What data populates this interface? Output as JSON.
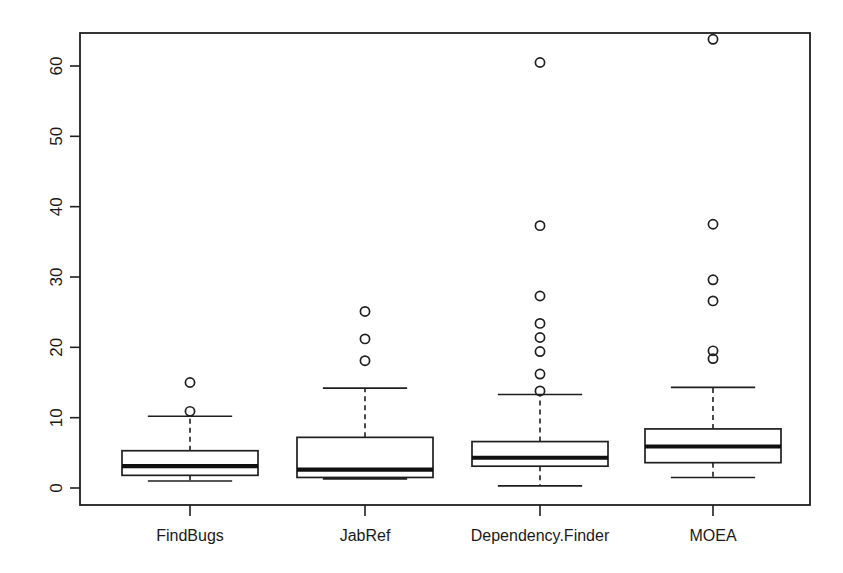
{
  "chart_data": {
    "type": "box",
    "title": "",
    "xlabel": "",
    "ylabel": "",
    "categories": [
      "FindBugs",
      "JabRef",
      "Dependency.Finder",
      "MOEA"
    ],
    "ylim": [
      -2.3,
      66.0
    ],
    "yticks": [
      0,
      10,
      20,
      30,
      40,
      50,
      60
    ],
    "ytick_labels": [
      "0",
      "10",
      "20",
      "30",
      "40",
      "50",
      "60"
    ],
    "ytick_labels_rotated": true,
    "grid": false,
    "legend": "none",
    "frame": "box",
    "series": [
      {
        "name": "FindBugs",
        "min_whisker": 1.0,
        "q1": 1.8,
        "median": 3.1,
        "q3": 5.3,
        "max_whisker": 10.2,
        "outliers": [
          15.0,
          10.9
        ]
      },
      {
        "name": "JabRef",
        "min_whisker": 1.3,
        "q1": 1.5,
        "median": 2.6,
        "q3": 7.2,
        "max_whisker": 14.2,
        "outliers": [
          25.1,
          21.2,
          18.1
        ]
      },
      {
        "name": "Dependency.Finder",
        "min_whisker": 0.3,
        "q1": 3.1,
        "median": 4.3,
        "q3": 6.6,
        "max_whisker": 13.3,
        "outliers": [
          60.5,
          37.3,
          27.3,
          23.4,
          21.4,
          19.4,
          16.2,
          13.8
        ]
      },
      {
        "name": "MOEA",
        "min_whisker": 1.5,
        "q1": 3.6,
        "median": 5.9,
        "q3": 8.4,
        "max_whisker": 14.3,
        "outliers": [
          63.8,
          37.5,
          29.6,
          26.6,
          19.5,
          18.4
        ]
      }
    ]
  },
  "colors": {
    "ink": "#1f1f1f",
    "median": "#101010",
    "background": "#ffffff"
  }
}
